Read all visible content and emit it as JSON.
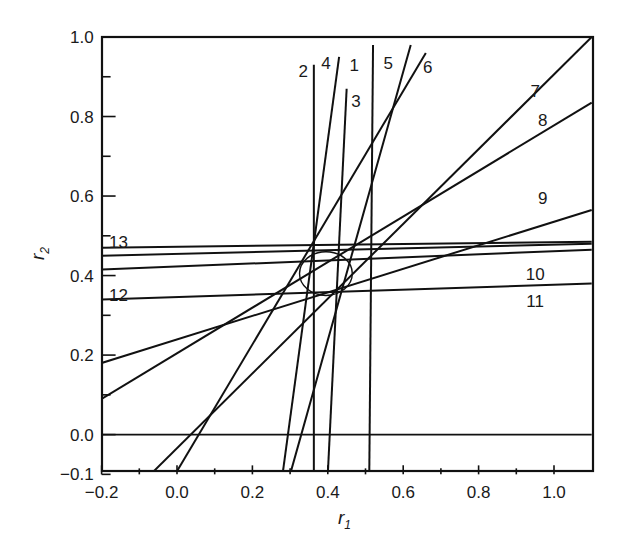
{
  "chart_data": {
    "type": "line",
    "title": "",
    "xlabel": "r1",
    "ylabel": "r2",
    "xlim": [
      -0.2,
      1.1
    ],
    "ylim": [
      -0.1,
      1.0
    ],
    "grid": false,
    "legend": "none (lines labelled inline 1-13)",
    "x_ticks": [
      -0.2,
      -0.1,
      0.0,
      0.1,
      0.2,
      0.3,
      0.4,
      0.5,
      0.6,
      0.7,
      0.8,
      0.9,
      1.0
    ],
    "x_tick_labels": [
      "-0.2",
      "0.0",
      "0.2",
      "0.4",
      "0.6",
      "0.8",
      "1.0"
    ],
    "x_tick_label_values": [
      -0.2,
      0.0,
      0.2,
      0.4,
      0.6,
      0.8,
      1.0
    ],
    "y_ticks": [
      -0.1,
      0.0,
      0.1,
      0.2,
      0.3,
      0.4,
      0.5,
      0.6,
      0.7,
      0.8,
      0.9,
      1.0
    ],
    "y_tick_labels": [
      "-0.1",
      "0.0",
      "0.2",
      "0.4",
      "0.6",
      "0.8",
      "1.0"
    ],
    "y_tick_label_values": [
      -0.1,
      0.0,
      0.2,
      0.4,
      0.6,
      0.8,
      1.0
    ],
    "reference_lines": [
      {
        "name": "r2 = 0",
        "y": 0.0
      }
    ],
    "series": [
      {
        "name": "1",
        "x": [
          0.51,
          0.52
        ],
        "y": [
          -0.1,
          0.98
        ],
        "label_pos": [
          0.47,
          0.93
        ]
      },
      {
        "name": "2",
        "x": [
          0.363,
          0.363
        ],
        "y": [
          -0.1,
          0.93
        ],
        "label_pos": [
          0.335,
          0.915
        ]
      },
      {
        "name": "3",
        "x": [
          0.4,
          0.45
        ],
        "y": [
          -0.1,
          0.87
        ],
        "label_pos": [
          0.475,
          0.84
        ]
      },
      {
        "name": "4",
        "x": [
          0.28,
          0.43
        ],
        "y": [
          -0.1,
          0.95
        ],
        "label_pos": [
          0.395,
          0.935
        ]
      },
      {
        "name": "5",
        "x": [
          0.3,
          0.62
        ],
        "y": [
          -0.1,
          0.98
        ],
        "label_pos": [
          0.56,
          0.935
        ]
      },
      {
        "name": "6",
        "x": [
          -0.005,
          0.66
        ],
        "y": [
          -0.1,
          0.96
        ],
        "label_pos": [
          0.665,
          0.925
        ]
      },
      {
        "name": "7",
        "x": [
          -0.07,
          1.1
        ],
        "y": [
          -0.1,
          1.0
        ],
        "label_pos": [
          0.95,
          0.865
        ]
      },
      {
        "name": "8",
        "x": [
          -0.2,
          1.1
        ],
        "y": [
          0.09,
          0.835
        ],
        "label_pos": [
          0.97,
          0.79
        ]
      },
      {
        "name": "9",
        "x": [
          -0.2,
          1.1
        ],
        "y": [
          0.18,
          0.565
        ],
        "label_pos": [
          0.97,
          0.595
        ]
      },
      {
        "name": "10",
        "x": [
          -0.2,
          1.1
        ],
        "y": [
          0.415,
          0.465
        ],
        "label_pos": [
          0.95,
          0.405
        ]
      },
      {
        "name": "11",
        "x": [
          -0.2,
          1.1
        ],
        "y": [
          0.34,
          0.38
        ],
        "label_pos": [
          0.95,
          0.335
        ]
      },
      {
        "name": "12",
        "x": [
          -0.2,
          1.1
        ],
        "y": [
          0.45,
          0.48
        ],
        "label_pos": [
          -0.155,
          0.35
        ]
      },
      {
        "name": "13",
        "x": [
          -0.2,
          1.1
        ],
        "y": [
          0.47,
          0.485
        ],
        "label_pos": [
          -0.155,
          0.485
        ]
      }
    ],
    "annotations": [
      {
        "type": "ellipse",
        "center": [
          0.395,
          0.405
        ],
        "rx": 0.07,
        "ry": 0.055,
        "description": "joint confidence region"
      }
    ]
  },
  "axes": {
    "x_title": "r",
    "x_sub": "1",
    "y_title": "r",
    "y_sub": "2"
  }
}
